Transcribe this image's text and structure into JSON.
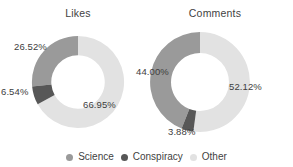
{
  "figure": {
    "panels": [
      {
        "title": "Likes"
      },
      {
        "title": "Comments"
      }
    ]
  },
  "legend": {
    "items": [
      {
        "label": "Science",
        "color": "#9a9a9a"
      },
      {
        "label": "Conspiracy",
        "color": "#575757"
      },
      {
        "label": "Other",
        "color": "#e2e2e2"
      }
    ]
  },
  "labels": {
    "likes": {
      "science": "26.52%",
      "conspiracy": "6.54%",
      "other": "66.95%"
    },
    "comments": {
      "science": "44.00%",
      "conspiracy": "3.88%",
      "other": "52.12%"
    }
  },
  "chart_data": {
    "type": "pie",
    "variant": "donut",
    "title": "",
    "charts": [
      {
        "title": "Likes",
        "categories": [
          "Science",
          "Conspiracy",
          "Other"
        ],
        "values": [
          26.52,
          6.54,
          66.95
        ],
        "value_labels": [
          "26.52%",
          "6.54%",
          "66.95%"
        ],
        "colors": [
          "#9a9a9a",
          "#575757",
          "#e2e2e2"
        ],
        "units": "percent",
        "start_angle_deg": 90,
        "direction": "counterclockwise",
        "inner_radius_ratio": 0.58
      },
      {
        "title": "Comments",
        "categories": [
          "Science",
          "Conspiracy",
          "Other"
        ],
        "values": [
          44.0,
          3.88,
          52.12
        ],
        "value_labels": [
          "44.00%",
          "3.88%",
          "52.12%"
        ],
        "colors": [
          "#9a9a9a",
          "#575757",
          "#e2e2e2"
        ],
        "units": "percent",
        "start_angle_deg": 90,
        "direction": "counterclockwise",
        "inner_radius_ratio": 0.58
      }
    ],
    "legend": [
      "Science",
      "Conspiracy",
      "Other"
    ],
    "legend_position": "bottom",
    "grid": false
  }
}
